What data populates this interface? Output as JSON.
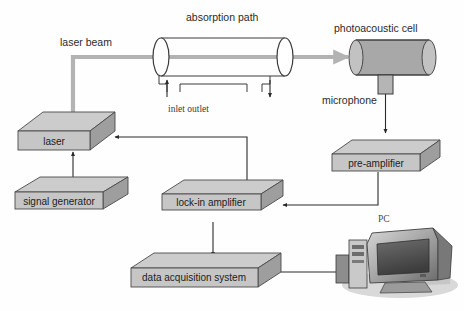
{
  "figure": {
    "background_color": "#fefefe"
  },
  "labels": {
    "laser_beam": "laser beam",
    "absorption_path": "absorption  path",
    "photoacoustic_cell": "photoacoustic cell",
    "inlet_outlet": "inlet outlet",
    "microphone": "microphone",
    "pc": "PC"
  },
  "components": [
    {
      "id": "laser",
      "label": "laser"
    },
    {
      "id": "signal-generator",
      "label": "signal generator"
    },
    {
      "id": "lock-in-amplifier",
      "label": "lock-in amplifier"
    },
    {
      "id": "pre-amplifier",
      "label": "pre-amplifier"
    },
    {
      "id": "data-acquisition",
      "label": "data acquisition system"
    }
  ],
  "colors": {
    "beam": "#b3b3b3",
    "wire": "#2a2a2a",
    "box_top": "#cccccc",
    "box_front": "#c6c6c6",
    "box_side": "#9e9e9e",
    "cell_fill": "#a8a8a8",
    "tube_fill": "#ffffff"
  }
}
